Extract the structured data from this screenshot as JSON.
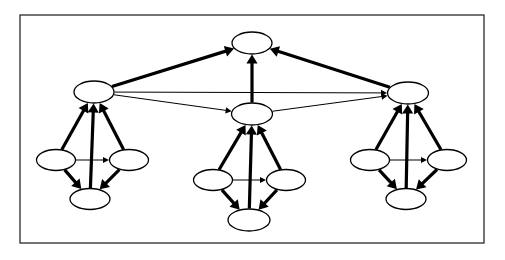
{
  "figure": {
    "background_color": "#ffffff",
    "stroke_color": "#000000",
    "node_fill_color": "#ffffff",
    "frame_color": "#3a3a3a"
  },
  "frame": {
    "name": "figure-border",
    "x": 20,
    "y": 15,
    "width": 464,
    "height": 228,
    "stroke_width": 1.4
  },
  "geometry": {
    "node_rx": 20,
    "node_ry": 11,
    "node_rx_small": 19.5,
    "node_ry_small": 10.5,
    "thick_stroke": 3.2,
    "thin_stroke": 1.0,
    "thick_arrow_size": 9,
    "thin_arrow_size": 6
  },
  "nodes": [
    {
      "id": "root",
      "name": "node-root",
      "cx": 252,
      "cy": 43,
      "rx": 20,
      "ry": 11,
      "level": 0,
      "cluster": "top"
    },
    {
      "id": "mid-left",
      "name": "node-mid-left",
      "cx": 94,
      "cy": 92,
      "rx": 20,
      "ry": 11,
      "level": 1,
      "cluster": "left"
    },
    {
      "id": "mid-center",
      "name": "node-mid-center",
      "cx": 252,
      "cy": 114,
      "rx": 20.5,
      "ry": 11,
      "level": 1,
      "cluster": "center"
    },
    {
      "id": "mid-right",
      "name": "node-mid-right",
      "cx": 408,
      "cy": 93,
      "rx": 20.5,
      "ry": 11,
      "level": 1,
      "cluster": "right"
    },
    {
      "id": "l-left",
      "name": "node-left-cluster-west",
      "cx": 56,
      "cy": 160,
      "rx": 19.5,
      "ry": 10.5,
      "level": 2,
      "cluster": "left"
    },
    {
      "id": "l-right",
      "name": "node-left-cluster-east",
      "cx": 129,
      "cy": 160,
      "rx": 19.5,
      "ry": 10.5,
      "level": 2,
      "cluster": "left"
    },
    {
      "id": "l-bot",
      "name": "node-left-cluster-south",
      "cx": 90,
      "cy": 199,
      "rx": 20,
      "ry": 10.5,
      "level": 2,
      "cluster": "left"
    },
    {
      "id": "c-left",
      "name": "node-center-cluster-west",
      "cx": 213,
      "cy": 180,
      "rx": 19.5,
      "ry": 10.5,
      "level": 2,
      "cluster": "center"
    },
    {
      "id": "c-right",
      "name": "node-center-cluster-east",
      "cx": 286,
      "cy": 180,
      "rx": 19.5,
      "ry": 10.5,
      "level": 2,
      "cluster": "center"
    },
    {
      "id": "c-bot",
      "name": "node-center-cluster-south",
      "cx": 249,
      "cy": 220,
      "rx": 21,
      "ry": 11,
      "level": 2,
      "cluster": "center"
    },
    {
      "id": "r-left",
      "name": "node-right-cluster-west",
      "cx": 370,
      "cy": 160,
      "rx": 19.5,
      "ry": 10.5,
      "level": 2,
      "cluster": "right"
    },
    {
      "id": "r-right",
      "name": "node-right-cluster-east",
      "cx": 447,
      "cy": 160,
      "rx": 19.5,
      "ry": 10.5,
      "level": 2,
      "cluster": "right"
    },
    {
      "id": "r-bot",
      "name": "node-right-cluster-south",
      "cx": 406,
      "cy": 199,
      "rx": 20,
      "ry": 10.5,
      "level": 2,
      "cluster": "right"
    }
  ],
  "edges": [
    {
      "name": "edge-mid-left-to-root",
      "from": "mid-left",
      "to": "root",
      "weight": "thick"
    },
    {
      "name": "edge-mid-center-to-root",
      "from": "mid-center",
      "to": "root",
      "weight": "thick"
    },
    {
      "name": "edge-mid-right-to-root",
      "from": "mid-right",
      "to": "root",
      "weight": "thick"
    },
    {
      "name": "edge-mid-left-to-mid-right",
      "from": "mid-left",
      "to": "mid-right",
      "weight": "thin"
    },
    {
      "name": "edge-mid-left-to-mid-center",
      "from": "mid-left",
      "to": "mid-center",
      "weight": "thin"
    },
    {
      "name": "edge-mid-center-to-mid-right",
      "from": "mid-center",
      "to": "mid-right",
      "weight": "thin"
    },
    {
      "name": "edge-left-west-to-mid-left",
      "from": "l-left",
      "to": "mid-left",
      "weight": "thick"
    },
    {
      "name": "edge-left-south-to-mid-left",
      "from": "l-bot",
      "to": "mid-left",
      "weight": "thick"
    },
    {
      "name": "edge-left-east-to-mid-left",
      "from": "l-right",
      "to": "mid-left",
      "weight": "thick"
    },
    {
      "name": "edge-left-west-to-left-east",
      "from": "l-left",
      "to": "l-right",
      "weight": "thin"
    },
    {
      "name": "edge-left-west-to-left-south",
      "from": "l-left",
      "to": "l-bot",
      "weight": "thick"
    },
    {
      "name": "edge-left-east-to-left-south",
      "from": "l-right",
      "to": "l-bot",
      "weight": "thick"
    },
    {
      "name": "edge-center-west-to-mid-center",
      "from": "c-left",
      "to": "mid-center",
      "weight": "thick"
    },
    {
      "name": "edge-center-south-to-mid-center",
      "from": "c-bot",
      "to": "mid-center",
      "weight": "thick"
    },
    {
      "name": "edge-center-east-to-mid-center",
      "from": "c-right",
      "to": "mid-center",
      "weight": "thick"
    },
    {
      "name": "edge-center-west-to-center-east",
      "from": "c-left",
      "to": "c-right",
      "weight": "thin"
    },
    {
      "name": "edge-center-west-to-center-south",
      "from": "c-left",
      "to": "c-bot",
      "weight": "thick"
    },
    {
      "name": "edge-center-east-to-center-south",
      "from": "c-right",
      "to": "c-bot",
      "weight": "thick"
    },
    {
      "name": "edge-right-west-to-mid-right",
      "from": "r-left",
      "to": "mid-right",
      "weight": "thick"
    },
    {
      "name": "edge-right-south-to-mid-right",
      "from": "r-bot",
      "to": "mid-right",
      "weight": "thick"
    },
    {
      "name": "edge-right-east-to-mid-right",
      "from": "r-right",
      "to": "mid-right",
      "weight": "thick"
    },
    {
      "name": "edge-right-west-to-right-east",
      "from": "r-left",
      "to": "r-right",
      "weight": "thin"
    },
    {
      "name": "edge-right-west-to-right-south",
      "from": "r-left",
      "to": "r-bot",
      "weight": "thick"
    },
    {
      "name": "edge-right-east-to-right-south",
      "from": "r-right",
      "to": "r-bot",
      "weight": "thick"
    }
  ]
}
